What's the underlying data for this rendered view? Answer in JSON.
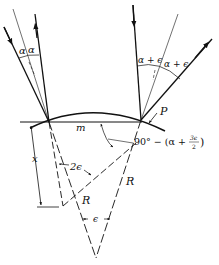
{
  "diagram": {
    "type": "optics-reflection-geometry",
    "labels": {
      "alpha_left_1": "α",
      "alpha_left_2": "α",
      "alpha_eps_1": "α + ϵ",
      "alpha_eps_2": "α + ϵ",
      "point_p": "P",
      "chord_m": "m",
      "angle_expr_prefix": "90° − (α + ",
      "angle_expr_num": "3ϵ",
      "angle_expr_den": "2",
      "angle_expr_suffix": ")",
      "two_eps": "2ϵ",
      "distance_x": "x",
      "radius_left": "R",
      "radius_right": "R",
      "eps_apex": "ϵ"
    },
    "colors": {
      "stroke": "#111111",
      "background": "#ffffff"
    }
  }
}
